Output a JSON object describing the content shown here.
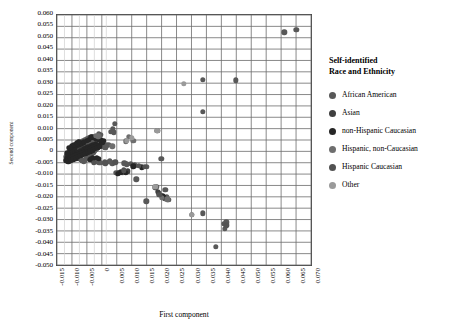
{
  "chart_data": {
    "type": "scatter",
    "title": "",
    "xlabel": "First component",
    "ylabel": "Second component",
    "xlim": [
      -0.015,
      0.07
    ],
    "ylim": [
      -0.05,
      0.06
    ],
    "xtick_step": 0.005,
    "ytick_step": 0.005,
    "grid": true,
    "legend_position": "right",
    "legend_title": "Self-identified Race and Ethnicity",
    "xticks": [
      "-0.015",
      "-0.010",
      "-0.005",
      "0",
      "0.005",
      "0.010",
      "0.015",
      "0.020",
      "0.025",
      "0.030",
      "0.035",
      "0.040",
      "0.045",
      "0.050",
      "0.055",
      "0.060",
      "0.065",
      "0.070"
    ],
    "yticks": [
      "0.060",
      "0.055",
      "0.050",
      "0.045",
      "0.040",
      "0.035",
      "0.030",
      "0.025",
      "0.020",
      "0.015",
      "0.010",
      "0.005",
      "0",
      "-0.005",
      "-0.010",
      "-0.015",
      "-0.020",
      "-0.025",
      "-0.030",
      "-0.035",
      "-0.040",
      "-0.045",
      "-0.050"
    ],
    "series": [
      {
        "name": "African American",
        "color": "#585858",
        "points": [
          [
            0.0335,
            0.0318
          ],
          [
            0.0443,
            0.0315
          ],
          [
            0.0645,
            0.0535
          ],
          [
            0.0605,
            0.0525
          ],
          [
            0.0335,
            0.0178
          ],
          [
            0.0183,
            0.0094
          ],
          [
            0.0405,
            -0.0312
          ],
          [
            0.0412,
            -0.0305
          ],
          [
            0.0408,
            -0.0332
          ],
          [
            0.0378,
            -0.0412
          ],
          [
            0.0335,
            -0.0265
          ],
          [
            0.0298,
            -0.0272
          ],
          [
            0.0215,
            -0.0193
          ],
          [
            0.0207,
            -0.0201
          ],
          [
            0.0219,
            -0.0206
          ],
          [
            0.0209,
            -0.0162
          ],
          [
            0.0189,
            -0.0178
          ],
          [
            0.0176,
            -0.0152
          ],
          [
            0.0181,
            -0.0149
          ],
          [
            0.0146,
            -0.0213
          ],
          [
            0.0196,
            -0.0028
          ],
          [
            0.0113,
            -0.0117
          ],
          [
            0.0148,
            -0.0063
          ],
          [
            0.0108,
            -0.0056
          ],
          [
            0.0095,
            -0.0049
          ],
          [
            0.0082,
            -0.0052
          ],
          [
            0.0074,
            -0.0047
          ],
          [
            0.0069,
            -0.0087
          ],
          [
            0.0051,
            -0.0091
          ],
          [
            0.0046,
            -0.0089
          ],
          [
            0.0033,
            -0.0047
          ],
          [
            0.0021,
            -0.0041
          ],
          [
            0.0009,
            -0.0043
          ],
          [
            0.0042,
            0.0126
          ],
          [
            0.0035,
            0.0103
          ],
          [
            0.0038,
            0.0088
          ],
          [
            0.0029,
            0.0091
          ],
          [
            -0.0011,
            0.0081
          ],
          [
            -0.0006,
            0.0078
          ],
          [
            -0.0018,
            0.0057
          ],
          [
            -0.0021,
            0.0062
          ],
          [
            -0.0029,
            0.0051
          ],
          [
            -0.0035,
            0.0054
          ],
          [
            -0.0042,
            0.0048
          ],
          [
            -0.0047,
            0.0041
          ],
          [
            -0.0054,
            0.0039
          ],
          [
            -0.0061,
            0.0033
          ],
          [
            -0.0066,
            0.0029
          ],
          [
            -0.0071,
            0.0026
          ],
          [
            -0.0076,
            0.0021
          ],
          [
            -0.0081,
            0.0017
          ],
          [
            -0.0085,
            0.0012
          ],
          [
            -0.0089,
            0.0007
          ],
          [
            -0.0093,
            0.0003
          ],
          [
            -0.0097,
            -0.0002
          ],
          [
            -0.0101,
            -0.0007
          ],
          [
            -0.0105,
            -0.0012
          ],
          [
            -0.0109,
            -0.0017
          ],
          [
            -0.0112,
            -0.0022
          ],
          [
            -0.0116,
            -0.0027
          ],
          [
            -0.0119,
            -0.0031
          ],
          [
            -0.0078,
            0.0044
          ],
          [
            -0.0083,
            0.0038
          ],
          [
            -0.0088,
            0.0033
          ],
          [
            -0.0092,
            0.0028
          ],
          [
            -0.0096,
            0.0022
          ],
          [
            -0.01,
            0.0016
          ],
          [
            -0.0104,
            0.0011
          ],
          [
            -0.0108,
            0.0005
          ],
          [
            -0.0111,
            -0.0001
          ],
          [
            -0.0114,
            -0.0006
          ],
          [
            -0.0064,
            0.0049
          ],
          [
            -0.0069,
            0.0044
          ],
          [
            -0.0073,
            0.0037
          ],
          [
            -0.0058,
            0.0053
          ],
          [
            -0.0051,
            0.0058
          ],
          [
            -0.0045,
            0.0061
          ],
          [
            -0.0039,
            0.0064
          ],
          [
            -0.0033,
            0.0067
          ],
          [
            -0.0026,
            0.0069
          ],
          [
            -0.0094,
            -0.0016
          ],
          [
            -0.0098,
            -0.0021
          ],
          [
            -0.0102,
            -0.0026
          ],
          [
            -0.0106,
            -0.0031
          ],
          [
            -0.0086,
            -0.0011
          ],
          [
            -0.009,
            -0.0006
          ],
          [
            -0.0082,
            -0.0016
          ],
          [
            -0.0078,
            -0.0021
          ],
          [
            -0.0074,
            -0.0026
          ],
          [
            -0.007,
            -0.0031
          ],
          [
            -0.0066,
            -0.0036
          ],
          [
            -0.0062,
            -0.0039
          ],
          [
            -0.0058,
            -0.0034
          ],
          [
            -0.0054,
            -0.0029
          ],
          [
            -0.005,
            -0.0024
          ],
          [
            -0.0046,
            -0.0019
          ],
          [
            -0.0042,
            -0.0014
          ],
          [
            -0.0038,
            -0.0009
          ],
          [
            -0.0034,
            -0.0004
          ],
          [
            -0.003,
            0.0001
          ],
          [
            -0.0026,
            0.0006
          ],
          [
            -0.0022,
            0.0011
          ],
          [
            -0.0018,
            0.0016
          ],
          [
            -0.0014,
            0.0021
          ],
          [
            -0.001,
            0.0026
          ],
          [
            -0.0006,
            0.0031
          ],
          [
            -0.0002,
            0.0036
          ],
          [
            -0.0062,
            0.0009
          ],
          [
            -0.0058,
            0.0014
          ],
          [
            -0.0054,
            0.0019
          ],
          [
            -0.005,
            0.0024
          ],
          [
            -0.0046,
            0.0029
          ],
          [
            -0.0042,
            0.0034
          ],
          [
            -0.0038,
            0.0039
          ],
          [
            -0.0086,
            0.0004
          ],
          [
            -0.0081,
            -0.0004
          ],
          [
            -0.0076,
            -0.0009
          ],
          [
            -0.0071,
            -0.0014
          ],
          [
            -0.012,
            -0.002
          ],
          [
            -0.0117,
            -0.0015
          ],
          [
            -0.0113,
            -0.001
          ],
          [
            -0.0109,
            -0.0005
          ],
          [
            0.0001,
            0.0029
          ],
          [
            0.0006,
            0.0024
          ],
          [
            0.0011,
            0.0019
          ],
          [
            -0.0014,
            -0.0034
          ],
          [
            -0.0019,
            -0.0038
          ],
          [
            -0.0024,
            -0.0041
          ],
          [
            -0.0029,
            -0.0036
          ],
          [
            0.0016,
            0.0032
          ],
          [
            0.0022,
            0.0034
          ],
          [
            -0.0004,
            -0.0044
          ],
          [
            -0.0009,
            -0.0046
          ],
          [
            0.0026,
            -0.0036
          ]
        ]
      },
      {
        "name": "Asian",
        "color": "#3f3f3f",
        "points": [
          [
            -0.0098,
            0.0018
          ],
          [
            -0.0089,
            0.0024
          ],
          [
            -0.0079,
            0.0031
          ],
          [
            -0.0069,
            0.0016
          ],
          [
            -0.0059,
            0.0011
          ],
          [
            -0.0049,
            0.0006
          ],
          [
            -0.0104,
            -0.0019
          ],
          [
            -0.0095,
            -0.0024
          ],
          [
            -0.0085,
            -0.0029
          ],
          [
            0.0056,
            -0.0088
          ],
          [
            0.0085,
            -0.0082
          ],
          [
            0.0185,
            -0.0173
          ]
        ]
      },
      {
        "name": "non-Hispanic Caucasian",
        "color": "#262626",
        "points": [
          [
            -0.0118,
            -0.0025
          ],
          [
            -0.011,
            -0.002
          ],
          [
            -0.0102,
            -0.0014
          ],
          [
            -0.0094,
            -0.0009
          ],
          [
            -0.0086,
            -0.0003
          ],
          [
            -0.0078,
            0.0002
          ],
          [
            -0.007,
            0.0007
          ],
          [
            -0.0062,
            0.0013
          ],
          [
            -0.0054,
            0.0018
          ],
          [
            -0.0046,
            0.0023
          ],
          [
            -0.0038,
            0.0028
          ],
          [
            -0.003,
            0.0033
          ],
          [
            -0.0022,
            0.0038
          ],
          [
            -0.0114,
            -0.0031
          ],
          [
            -0.0106,
            -0.0026
          ],
          [
            -0.0098,
            -0.0021
          ],
          [
            -0.009,
            -0.0016
          ],
          [
            -0.0082,
            -0.0011
          ],
          [
            -0.0074,
            -0.0006
          ],
          [
            -0.0066,
            -0.0001
          ],
          [
            -0.0058,
            0.0004
          ],
          [
            -0.005,
            0.0009
          ],
          [
            -0.0042,
            0.0014
          ],
          [
            -0.0034,
            0.0019
          ],
          [
            -0.0026,
            0.0024
          ],
          [
            -0.0018,
            0.0029
          ],
          [
            -0.001,
            0.0034
          ],
          [
            -0.0002,
            0.0041
          ],
          [
            -0.012,
            -0.0036
          ],
          [
            -0.0112,
            -0.004
          ],
          [
            -0.0104,
            -0.0035
          ],
          [
            -0.0096,
            -0.003
          ],
          [
            -0.0088,
            -0.0025
          ],
          [
            -0.008,
            -0.002
          ],
          [
            -0.0072,
            -0.0015
          ],
          [
            -0.0064,
            -0.001
          ],
          [
            -0.0056,
            -0.0005
          ],
          [
            -0.0048,
            0.0
          ],
          [
            -0.004,
            0.0005
          ],
          [
            -0.0032,
            0.001
          ],
          [
            -0.0024,
            0.0015
          ],
          [
            -0.0016,
            0.002
          ],
          [
            -0.0008,
            0.0025
          ],
          [
            0.0,
            0.0045
          ],
          [
            0.0004,
            0.005
          ],
          [
            -0.0006,
            0.0055
          ],
          [
            -0.0012,
            0.0058
          ],
          [
            -0.002,
            0.006
          ],
          [
            -0.0028,
            0.0063
          ],
          [
            -0.0036,
            0.0066
          ],
          [
            -0.0044,
            0.0055
          ],
          [
            -0.0052,
            0.005
          ],
          [
            -0.006,
            0.0045
          ],
          [
            -0.0068,
            0.004
          ],
          [
            -0.0076,
            0.0035
          ],
          [
            -0.0084,
            0.003
          ],
          [
            -0.0092,
            0.0013
          ],
          [
            -0.01,
            0.0008
          ],
          [
            -0.0108,
            0.0002
          ],
          [
            -0.0116,
            -0.0004
          ],
          [
            -0.0101,
            0.0029
          ],
          [
            -0.0093,
            0.0034
          ],
          [
            -0.0085,
            0.004
          ],
          [
            -0.0077,
            0.0046
          ],
          [
            -0.0109,
            0.002
          ],
          [
            -0.0031,
            -0.0025
          ],
          [
            -0.0036,
            -0.003
          ],
          [
            -0.0041,
            -0.0033
          ],
          [
            -0.0012,
            -0.0028
          ],
          [
            -0.0017,
            -0.0024
          ],
          [
            0.0052,
            -0.0093
          ],
          [
            0.0061,
            -0.0086
          ],
          [
            0.0078,
            -0.009
          ],
          [
            0.0104,
            -0.006
          ],
          [
            0.0131,
            -0.0065
          ],
          [
            0.0199,
            -0.0188
          ],
          [
            0.0203,
            -0.0196
          ]
        ]
      },
      {
        "name": "Hispanic, non-Caucasian",
        "color": "#6e6e6e",
        "points": [
          [
            0.0089,
            0.0067
          ],
          [
            0.0079,
            0.0048
          ],
          [
            0.0104,
            0.0051
          ],
          [
            0.0033,
            0.0027
          ],
          [
            -0.0021,
            0.0074
          ],
          [
            -0.0013,
            0.007
          ],
          [
            0.0216,
            -0.0205
          ],
          [
            0.0198,
            -0.0199
          ]
        ]
      },
      {
        "name": "Hispanic Caucasian",
        "color": "#525252",
        "points": [
          [
            -0.0027,
            -0.0044
          ],
          [
            0.0011,
            -0.0047
          ],
          [
            0.0043,
            -0.0043
          ],
          [
            0.0071,
            -0.0078
          ],
          [
            0.0122,
            -0.0058
          ],
          [
            0.0141,
            -0.0062
          ],
          [
            0.0178,
            -0.0155
          ],
          [
            0.019,
            -0.0185
          ],
          [
            0.0412,
            -0.0318
          ]
        ]
      },
      {
        "name": "Other",
        "color": "#9a9a9a",
        "points": [
          [
            0.0272,
            0.03
          ],
          [
            0.0183,
            0.0094
          ],
          [
            0.0082,
            0.005
          ],
          [
            0.0098,
            0.0064
          ],
          [
            0.0298,
            -0.0272
          ],
          [
            0.0176,
            -0.0151
          ]
        ]
      }
    ]
  },
  "legend": {
    "title_line1": "Self-identified",
    "title_line2": "Race and Ethnicity",
    "items": [
      {
        "label": "African American",
        "color": "#585858"
      },
      {
        "label": "Asian",
        "color": "#3f3f3f"
      },
      {
        "label": "non-Hispanic Caucasian",
        "color": "#262626"
      },
      {
        "label": "Hispanic, non-Caucasian",
        "color": "#6e6e6e"
      },
      {
        "label": "Hispanic Caucasian",
        "color": "#525252"
      },
      {
        "label": "Other",
        "color": "#9a9a9a"
      }
    ]
  },
  "axes": {
    "x_title": "First component",
    "y_title": "Second component"
  },
  "style": {
    "grid_color": "#6b6b6b",
    "minor_grid_color": "#cfcfcf",
    "frame_color": "#4a4a4a"
  }
}
